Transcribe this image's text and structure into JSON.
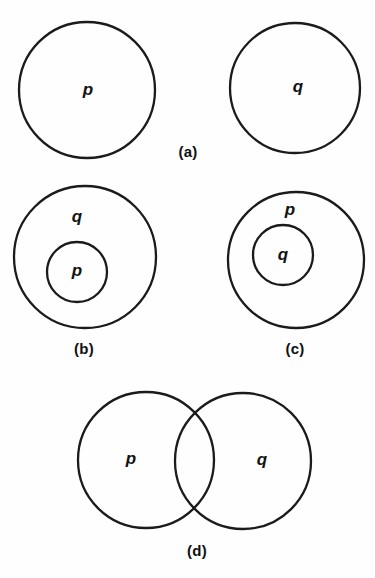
{
  "figure": {
    "background_color": "#fefefe",
    "stroke_color": "#1b1b1b",
    "label_color": "#131313",
    "caption_color": "#101010"
  },
  "panels": [
    {
      "id": "a",
      "caption": "(a)",
      "caption_x": 188,
      "caption_y": 153,
      "relation": "disjoint",
      "circles": [
        {
          "name": "p",
          "cx": 87,
          "cy": 90,
          "r": 68
        },
        {
          "name": "q",
          "cx": 295,
          "cy": 88,
          "r": 65
        }
      ],
      "labels": [
        {
          "text": "p",
          "x": 88,
          "y": 91
        },
        {
          "text": "q",
          "x": 298,
          "y": 88
        }
      ]
    },
    {
      "id": "b",
      "caption": "(b)",
      "caption_x": 84,
      "caption_y": 350,
      "relation": "p-inside-q",
      "circles": [
        {
          "name": "q",
          "cx": 85,
          "cy": 257,
          "r": 71
        },
        {
          "name": "p",
          "cx": 77,
          "cy": 272,
          "r": 30
        }
      ],
      "labels": [
        {
          "text": "q",
          "x": 77,
          "y": 218
        },
        {
          "text": "p",
          "x": 77,
          "y": 272
        }
      ]
    },
    {
      "id": "c",
      "caption": "(c)",
      "caption_x": 295,
      "caption_y": 350,
      "relation": "q-inside-p",
      "circles": [
        {
          "name": "p",
          "cx": 296,
          "cy": 260,
          "r": 68
        },
        {
          "name": "q",
          "cx": 283,
          "cy": 255,
          "r": 30
        }
      ],
      "labels": [
        {
          "text": "p",
          "x": 290,
          "y": 211
        },
        {
          "text": "q",
          "x": 283,
          "y": 256
        }
      ]
    },
    {
      "id": "d",
      "caption": "(d)",
      "caption_x": 197,
      "caption_y": 552,
      "relation": "overlapping",
      "circles": [
        {
          "name": "p",
          "cx": 146,
          "cy": 460,
          "r": 68
        },
        {
          "name": "q",
          "cx": 243,
          "cy": 461,
          "r": 68
        }
      ],
      "labels": [
        {
          "text": "p",
          "x": 131,
          "y": 460
        },
        {
          "text": "q",
          "x": 262,
          "y": 461
        }
      ]
    }
  ],
  "chart_data": {
    "type": "diagram",
    "variables": [
      "p",
      "q"
    ],
    "panels": [
      {
        "label": "(a)",
        "relation": "disjoint",
        "sets": [
          "p",
          "q"
        ]
      },
      {
        "label": "(b)",
        "relation": "p subset of q",
        "sets": [
          "q",
          "p"
        ]
      },
      {
        "label": "(c)",
        "relation": "q subset of p",
        "sets": [
          "p",
          "q"
        ]
      },
      {
        "label": "(d)",
        "relation": "p intersects q",
        "sets": [
          "p",
          "q"
        ]
      }
    ]
  }
}
